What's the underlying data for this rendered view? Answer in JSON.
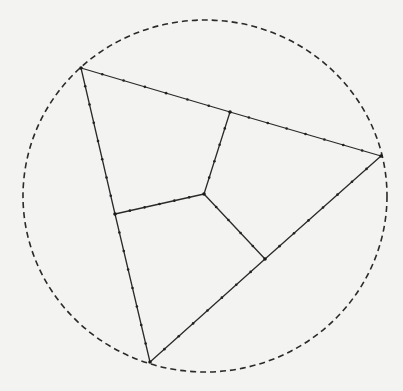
{
  "diagram": {
    "colors": {
      "background": "#f3f3f1",
      "ink": "#2a2a2a"
    },
    "circle": {
      "style": "dashed"
    },
    "vertices": [
      {
        "id": "A",
        "role": "top-left vertex"
      },
      {
        "id": "B",
        "role": "right vertex"
      },
      {
        "id": "C",
        "role": "bottom vertex"
      },
      {
        "id": "O",
        "role": "interior point"
      },
      {
        "id": "P",
        "role": "point on side AB"
      },
      {
        "id": "Q",
        "role": "point on side AC"
      },
      {
        "id": "R",
        "role": "point on side BC"
      }
    ],
    "edges": [
      {
        "from": "A",
        "to": "P",
        "dots": 6
      },
      {
        "from": "P",
        "to": "B",
        "dots": 7
      },
      {
        "from": "A",
        "to": "Q",
        "dots": 7
      },
      {
        "from": "Q",
        "to": "C",
        "dots": 7
      },
      {
        "from": "C",
        "to": "R",
        "dots": 7
      },
      {
        "from": "R",
        "to": "B",
        "dots": 7
      },
      {
        "from": "O",
        "to": "P",
        "dots": 4
      },
      {
        "from": "O",
        "to": "Q",
        "dots": 5
      },
      {
        "from": "O",
        "to": "R",
        "dots": 4
      }
    ]
  }
}
